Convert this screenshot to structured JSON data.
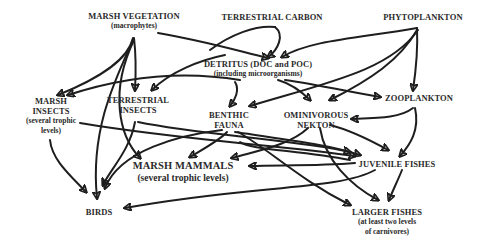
{
  "diagram": {
    "type": "food-web",
    "nodes": {
      "marsh_vegetation": {
        "label": "MARSH VEGETATION",
        "sub": "(macrophytes)"
      },
      "terrestrial_carbon": {
        "label": "TERRESTRIAL CARBON"
      },
      "phytoplankton": {
        "label": "PHYTOPLANKTON"
      },
      "detritus": {
        "label": "DETRITUS (DOC and POC)",
        "sub": "(including microorganisms)"
      },
      "zooplankton": {
        "label": "ZOOPLANKTON"
      },
      "marsh_insects": {
        "label": "MARSH",
        "label2": "INSECTS",
        "sub": "(several  trophic",
        "sub2": "levels)"
      },
      "terrestrial_insects": {
        "label": "TERRESTRIAL",
        "label2": "INSECTS"
      },
      "benthic_fauna": {
        "label": "BENTHIC",
        "label2": "FAUNA"
      },
      "ominivorous_nekton": {
        "label": "OMINIVOROUS",
        "label2": "NEKTON"
      },
      "marsh_mammals": {
        "label": "MARSH MAMMALS",
        "sub": "(several trophic levels)"
      },
      "juvenile_fishes": {
        "label": "JUVENILE FISHES"
      },
      "birds": {
        "label": "BIRDS"
      },
      "larger_fishes": {
        "label": "LARGER FISHES",
        "sub": "(at least two levels",
        "sub2": "of carnivores)"
      }
    },
    "edges": [
      [
        "marsh_vegetation",
        "marsh_insects"
      ],
      [
        "marsh_vegetation",
        "terrestrial_insects"
      ],
      [
        "marsh_vegetation",
        "detritus"
      ],
      [
        "marsh_vegetation",
        "birds"
      ],
      [
        "marsh_vegetation",
        "marsh_mammals"
      ],
      [
        "terrestrial_carbon",
        "detritus"
      ],
      [
        "phytoplankton",
        "detritus"
      ],
      [
        "phytoplankton",
        "zooplankton"
      ],
      [
        "phytoplankton",
        "benthic_fauna"
      ],
      [
        "phytoplankton",
        "ominivorous_nekton"
      ],
      [
        "detritus",
        "terrestrial_insects"
      ],
      [
        "detritus",
        "marsh_insects"
      ],
      [
        "detritus",
        "benthic_fauna"
      ],
      [
        "detritus",
        "ominivorous_nekton"
      ],
      [
        "detritus",
        "zooplankton"
      ],
      [
        "zooplankton",
        "ominivorous_nekton"
      ],
      [
        "zooplankton",
        "juvenile_fishes"
      ],
      [
        "marsh_insects",
        "birds"
      ],
      [
        "marsh_insects",
        "juvenile_fishes"
      ],
      [
        "terrestrial_insects",
        "birds"
      ],
      [
        "terrestrial_insects",
        "juvenile_fishes"
      ],
      [
        "benthic_fauna",
        "marsh_mammals"
      ],
      [
        "benthic_fauna",
        "birds"
      ],
      [
        "benthic_fauna",
        "juvenile_fishes"
      ],
      [
        "benthic_fauna",
        "larger_fishes"
      ],
      [
        "ominivorous_nekton",
        "marsh_mammals"
      ],
      [
        "ominivorous_nekton",
        "juvenile_fishes"
      ],
      [
        "ominivorous_nekton",
        "larger_fishes"
      ],
      [
        "juvenile_fishes",
        "marsh_mammals"
      ],
      [
        "juvenile_fishes",
        "birds"
      ],
      [
        "juvenile_fishes",
        "larger_fishes"
      ]
    ],
    "colors": {
      "text": "#2a2a2a",
      "arrow": "#1e1e1e",
      "background": "#ffffff"
    }
  }
}
